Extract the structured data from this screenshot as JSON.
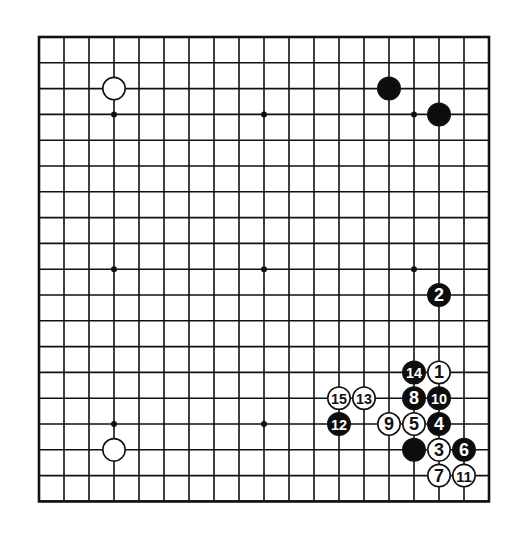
{
  "board": {
    "size": 19,
    "origin": {
      "x": 39,
      "y": 37
    },
    "spacing": {
      "x": 25.0,
      "y": 25.8
    },
    "line_color": "#111111",
    "background": "#ffffff",
    "star_points": [
      [
        3,
        3
      ],
      [
        9,
        3
      ],
      [
        15,
        3
      ],
      [
        3,
        9
      ],
      [
        9,
        9
      ],
      [
        15,
        9
      ],
      [
        3,
        15
      ],
      [
        9,
        15
      ],
      [
        15,
        15
      ]
    ]
  },
  "stones": [
    {
      "color": "white",
      "col": 3,
      "row": 2,
      "label": ""
    },
    {
      "color": "black",
      "col": 14,
      "row": 2,
      "label": ""
    },
    {
      "color": "black",
      "col": 16,
      "row": 3,
      "label": ""
    },
    {
      "color": "white",
      "col": 3,
      "row": 16,
      "label": ""
    },
    {
      "color": "black",
      "col": 15,
      "row": 16,
      "label": ""
    },
    {
      "color": "white",
      "col": 16,
      "row": 13,
      "label": "1"
    },
    {
      "color": "black",
      "col": 16,
      "row": 10,
      "label": "2"
    },
    {
      "color": "white",
      "col": 16,
      "row": 16,
      "label": "3"
    },
    {
      "color": "black",
      "col": 16,
      "row": 15,
      "label": "4"
    },
    {
      "color": "white",
      "col": 15,
      "row": 15,
      "label": "5"
    },
    {
      "color": "black",
      "col": 17,
      "row": 16,
      "label": "6"
    },
    {
      "color": "white",
      "col": 16,
      "row": 17,
      "label": "7"
    },
    {
      "color": "black",
      "col": 15,
      "row": 14,
      "label": "8"
    },
    {
      "color": "white",
      "col": 14,
      "row": 15,
      "label": "9"
    },
    {
      "color": "black",
      "col": 16,
      "row": 14,
      "label": "10"
    },
    {
      "color": "white",
      "col": 17,
      "row": 17,
      "label": "11"
    },
    {
      "color": "black",
      "col": 12,
      "row": 15,
      "label": "12"
    },
    {
      "color": "white",
      "col": 13,
      "row": 14,
      "label": "13"
    },
    {
      "color": "black",
      "col": 15,
      "row": 13,
      "label": "14"
    },
    {
      "color": "white",
      "col": 12,
      "row": 14,
      "label": "15"
    }
  ]
}
